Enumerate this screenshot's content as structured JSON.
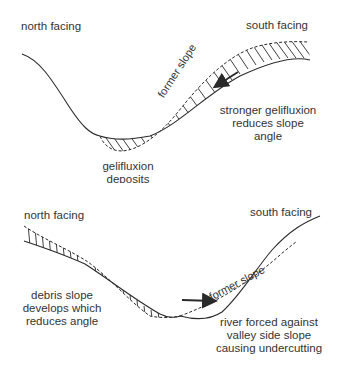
{
  "top_diagram": {
    "north_label": "north facing",
    "south_label": "south facing",
    "former_slope_label": "former slope",
    "explanation_lines": [
      "stronger gelifluxion",
      "reduces slope",
      "angle"
    ],
    "deposit_lines": [
      "gelifluxion",
      "deposits"
    ]
  },
  "bottom_diagram": {
    "north_label": "north facing",
    "south_label": "south facing",
    "former_slope_label": "former slope",
    "debris_lines": [
      "debris slope",
      "develops which",
      "reduces angle"
    ],
    "river_lines": [
      "river forced against",
      "valley side slope",
      "causing undercutting"
    ]
  },
  "colors": {
    "line": "#2a2a2a",
    "text": "#333333",
    "background": "#ffffff"
  }
}
